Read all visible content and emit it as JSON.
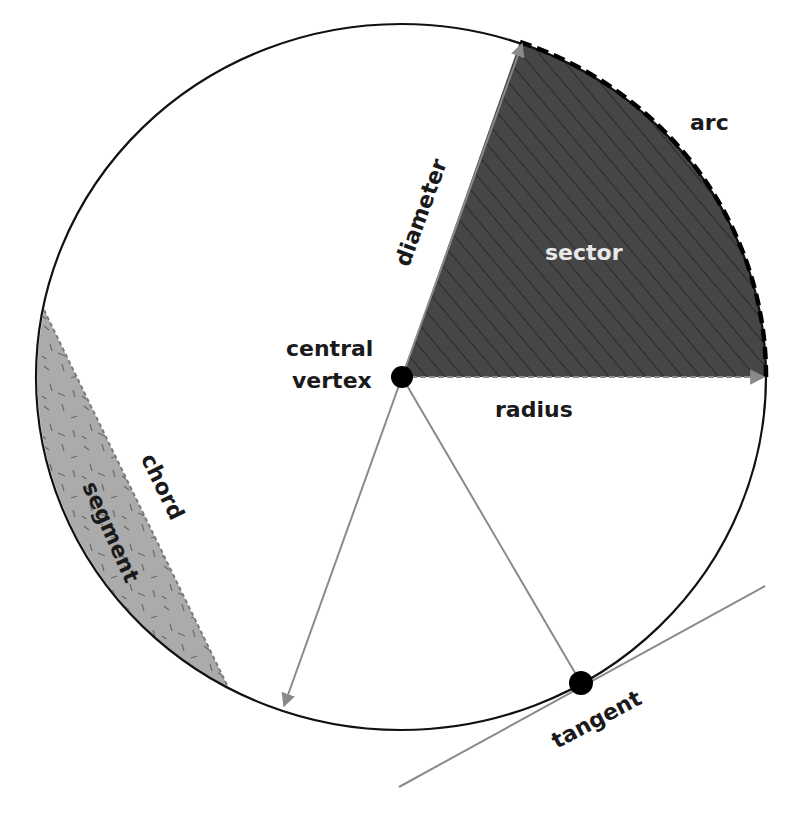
{
  "diagram": {
    "colors": {
      "background": "#ffffff",
      "circle_stroke": "#111111",
      "sector_fill": "#464646",
      "sector_hatch": "#222222",
      "segment_fill": "#ababab",
      "segment_speckle": "#666666",
      "arrow_gray": "#8a8a8a",
      "point": "#000000",
      "label_dark": "#1a1a1a",
      "label_light": "#e8e8e8"
    },
    "circle": {
      "cx": 401,
      "cy": 377,
      "rx": 365,
      "ry": 353
    },
    "center_point": {
      "x": 402,
      "y": 377
    },
    "tangent_point": {
      "x": 581,
      "y": 683
    },
    "labels": {
      "arc": "arc",
      "sector": "sector",
      "diameter": "diameter",
      "central": "central",
      "vertex": "vertex",
      "radius": "radius",
      "chord": "chord",
      "segment": "segment",
      "tangent": "tangent"
    }
  }
}
